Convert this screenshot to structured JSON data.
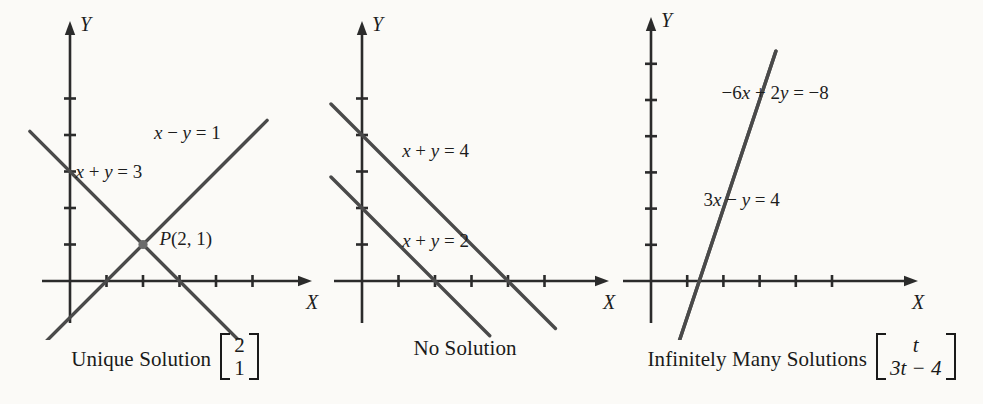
{
  "figure": {
    "background_color": "#fbfaf7",
    "line_color": "#4a4a4a",
    "axis_color": "#2b2b2b"
  },
  "chart_data": {
    "type": "line",
    "title": "",
    "panels": [
      {
        "id": "unique-solution",
        "caption": "Unique Solution",
        "solution_vector": [
          "2",
          "1"
        ],
        "xlabel": "X",
        "ylabel": "Y",
        "xlim": [
          -1,
          6
        ],
        "ylim": [
          -2,
          6
        ],
        "x_ticks": [
          1,
          2,
          3,
          4,
          5
        ],
        "y_ticks": [
          1,
          2,
          3,
          4,
          5
        ],
        "grid": false,
        "series": [
          {
            "name": "x - y = 1",
            "label_parts": [
              "x",
              " − ",
              "y",
              " = 1"
            ],
            "slope": 1,
            "intercept": -1,
            "x_from": -1.1,
            "x_to": 5.4,
            "label_xy": [
              2.3,
              4.05
            ]
          },
          {
            "name": "x + y = 3",
            "label_parts": [
              "x",
              " + ",
              "y",
              " = 3"
            ],
            "slope": -1,
            "intercept": 3,
            "x_from": -1.1,
            "x_to": 5.4,
            "label_xy": [
              0.15,
              3.0
            ]
          }
        ],
        "points": [
          {
            "name": "P",
            "label": "P(2, 1)",
            "x": 2,
            "y": 1,
            "label_xy": [
              2.45,
              1.15
            ]
          }
        ]
      },
      {
        "id": "no-solution",
        "caption": "No Solution",
        "solution_vector": null,
        "xlabel": "X",
        "ylabel": "Y",
        "xlim": [
          -1,
          6
        ],
        "ylim": [
          -2,
          6
        ],
        "x_ticks": [
          1,
          2,
          3,
          4,
          5
        ],
        "y_ticks": [
          1,
          2,
          3,
          4,
          5
        ],
        "grid": false,
        "series": [
          {
            "name": "x + y = 4",
            "label_parts": [
              "x",
              " + ",
              "y",
              " = 4"
            ],
            "slope": -1,
            "intercept": 4,
            "x_from": -0.85,
            "x_to": 5.3,
            "label_xy": [
              1.1,
              3.55
            ]
          },
          {
            "name": "x + y = 2",
            "label_parts": [
              "x",
              " + ",
              "y",
              " = 2"
            ],
            "slope": -1,
            "intercept": 2,
            "x_from": -0.85,
            "x_to": 3.5,
            "label_xy": [
              1.1,
              1.1
            ]
          }
        ],
        "points": []
      },
      {
        "id": "infinitely-many-solutions",
        "caption": "Infinitely Many Solutions",
        "solution_vector": [
          "t",
          "3t − 4"
        ],
        "xlabel": "X",
        "ylabel": "Y",
        "xlim": [
          -1,
          6
        ],
        "ylim": [
          -2,
          7
        ],
        "x_ticks": [
          1,
          2,
          3,
          4,
          5
        ],
        "y_ticks": [
          1,
          2,
          3,
          4,
          5,
          6
        ],
        "grid": false,
        "series": [
          {
            "name": "-6x + 2y = -8",
            "label_parts": [
              "−6",
              "x",
              " + 2",
              "y",
              " = −8"
            ],
            "slope": 3,
            "intercept": -4,
            "x_from": 0.55,
            "x_to": 3.45,
            "label_xy": [
              1.95,
              5.2
            ]
          },
          {
            "name": "3x - y = 4",
            "label_parts": [
              "3",
              "x",
              " − ",
              "y",
              " = 4"
            ],
            "slope": 3,
            "intercept": -4,
            "x_from": 0.55,
            "x_to": 3.45,
            "label_xy": [
              1.45,
              2.25
            ]
          }
        ],
        "points": []
      }
    ]
  }
}
